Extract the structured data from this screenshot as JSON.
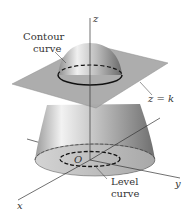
{
  "figure": {
    "labels": {
      "contour_line1": "Contour",
      "contour_line2": "curve",
      "plane": "z = k",
      "origin": "O",
      "level_line1": "Level",
      "level_line2": "curve",
      "x_axis": "x",
      "y_axis": "y",
      "z_axis": "z"
    },
    "colors": {
      "plane": "#a9a9a9",
      "surface_light": "#e6e6e6",
      "surface_dark": "#7a7a7a",
      "base": "#c8c8c8",
      "line": "#222222"
    }
  }
}
